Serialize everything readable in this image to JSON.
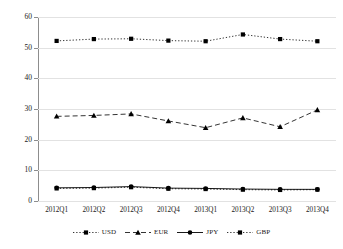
{
  "chart_data": {
    "type": "line",
    "title": "",
    "subtitle": "",
    "xlabel": "",
    "ylabel": "",
    "categories": [
      "2012Q1",
      "2012Q2",
      "2012Q3",
      "2012Q4",
      "2013Q1",
      "2013Q2",
      "2013Q3",
      "2013Q4"
    ],
    "series": [
      {
        "name": "USD",
        "values": [
          52.2,
          52.8,
          52.9,
          52.3,
          52.1,
          54.3,
          52.8,
          52.1
        ],
        "marker": "square",
        "dash": "dotted",
        "color": "#000000"
      },
      {
        "name": "EUR",
        "values": [
          27.6,
          27.9,
          28.4,
          26.1,
          23.9,
          27.1,
          24.2,
          29.7
        ],
        "marker": "triangle",
        "dash": "dashed",
        "color": "#000000"
      },
      {
        "name": "JPY",
        "values": [
          4.3,
          4.4,
          4.7,
          4.2,
          4.1,
          3.9,
          3.8,
          3.8
        ],
        "marker": "circle",
        "dash": "solid",
        "color": "#000000"
      },
      {
        "name": "GBP",
        "values": [
          4.1,
          4.2,
          4.5,
          4.0,
          3.9,
          3.7,
          3.6,
          3.7
        ],
        "marker": "square",
        "dash": "dotted",
        "color": "#000000"
      }
    ],
    "ylim": [
      0,
      60
    ],
    "yticks": [
      0,
      10,
      20,
      30,
      40,
      50,
      60
    ],
    "ytick_labels": [
      "0",
      "10",
      "20",
      "30",
      "40",
      "50",
      "60"
    ],
    "grid": true,
    "grid_axis": "y",
    "legend_position": "bottom",
    "legend_entries": [
      "USD",
      "EUR",
      "JPY",
      "GBP"
    ]
  },
  "axes": {
    "y_labels": [
      "60",
      "50",
      "40",
      "30",
      "20",
      "10",
      "0"
    ],
    "x_labels": [
      "2012Q1",
      "2012Q2",
      "2012Q3",
      "2012Q4",
      "2013Q1",
      "2013Q2",
      "2013Q3",
      "2013Q4"
    ]
  },
  "legend": {
    "items": [
      {
        "label": "USD"
      },
      {
        "label": "EUR"
      },
      {
        "label": "JPY"
      },
      {
        "label": "GBP"
      }
    ]
  },
  "colors": {
    "ink": "#000000",
    "grid": "#e2e2e2",
    "axis": "#8d8d8d",
    "background": "#ffffff"
  }
}
